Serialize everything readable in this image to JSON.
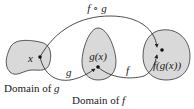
{
  "diagram": {
    "top_arrow_label": "f ∘ g",
    "sets": [
      {
        "name": "domain-of-g",
        "caption": "Domain of ",
        "caption_var": "g",
        "point_label": "x"
      },
      {
        "name": "domain-of-f",
        "caption": "Domain of ",
        "caption_var": "f",
        "point_label": "g(x)"
      },
      {
        "name": "codomain",
        "point_label": "f(g(x))"
      }
    ],
    "arrows": [
      {
        "label": "g",
        "from": "x",
        "to": "g(x)"
      },
      {
        "label": "f",
        "from": "g(x)",
        "to": "f(g(x))"
      },
      {
        "label": "f ∘ g",
        "from": "x",
        "to": "f(g(x))"
      }
    ],
    "colors": {
      "region_fill": "#d9d9d9",
      "region_stroke": "#333333",
      "line": "#222222",
      "text": "#1a1a1a"
    }
  }
}
